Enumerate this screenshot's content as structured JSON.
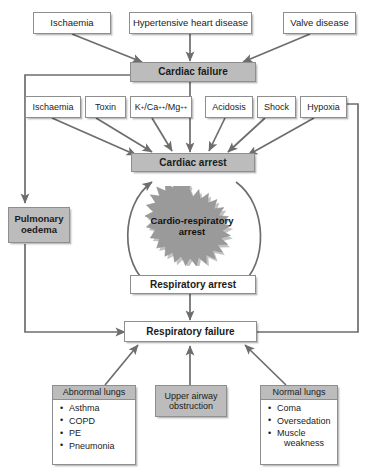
{
  "diagram": {
    "colors": {
      "node_fill_gray": "#bcbcbc",
      "node_fill_white": "#ffffff",
      "border": "#8e8e8e",
      "connector": "#6d6d6d",
      "burst_fill": "#9a9a9a",
      "text": "#1b1b1b"
    },
    "causes_top": [
      {
        "id": "ischaemia-top",
        "label": "Ischaemia"
      },
      {
        "id": "hypertensive-heart-disease",
        "label": "Hypertensive heart disease"
      },
      {
        "id": "valve-disease",
        "label": "Valve disease"
      }
    ],
    "cardiac_failure": {
      "label": "Cardiac failure"
    },
    "causes_mid": [
      {
        "id": "ischaemia-mid",
        "label": "Ischaemia"
      },
      {
        "id": "toxin",
        "label": "Toxin"
      },
      {
        "id": "electrolytes",
        "label": "K+/Ca++/Mg++",
        "html": "K<sup>+</sup>/Ca<sup>++</sup>/Mg<sup>++</sup>"
      },
      {
        "id": "acidosis",
        "label": "Acidosis"
      },
      {
        "id": "shock",
        "label": "Shock"
      },
      {
        "id": "hypoxia",
        "label": "Hypoxia"
      }
    ],
    "cardiac_arrest": {
      "label": "Cardiac arrest"
    },
    "pulmonary_oedema": {
      "label": "Pulmonary oedema",
      "line1": "Pulmonary",
      "line2": "oedema"
    },
    "cardio_respiratory_arrest": {
      "label": "Cardio-respiratory arrest",
      "line1": "Cardio-respiratory",
      "line2": "arrest"
    },
    "respiratory_arrest": {
      "label": "Respiratory arrest"
    },
    "respiratory_failure": {
      "label": "Respiratory failure"
    },
    "causes_bottom": [
      {
        "id": "abnormal-lungs",
        "header": "Abnormal lungs",
        "items": [
          "Asthma",
          "COPD",
          "PE",
          "Pneumonia"
        ]
      },
      {
        "id": "upper-airway-obstruction",
        "header": "Upper airway obstruction",
        "line1": "Upper airway",
        "line2": "obstruction"
      },
      {
        "id": "normal-lungs",
        "header": "Normal lungs",
        "items": [
          "Coma",
          "Oversedation",
          "Muscle weakness"
        ],
        "items_wrapped": [
          {
            "text": "Coma"
          },
          {
            "text": "Oversedation"
          },
          {
            "text": "Muscle",
            "cont": "weakness"
          }
        ]
      }
    ]
  }
}
